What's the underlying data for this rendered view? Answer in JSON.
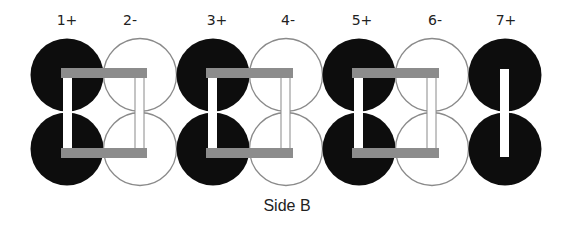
{
  "diagram": {
    "caption": "Side B",
    "colors": {
      "positive_fill": "#0d0d0d",
      "negative_fill": "#ffffff",
      "negative_stroke": "#8a8a8a",
      "bar_fill": "#8c8c8c",
      "post_fill": "#ffffff",
      "post_stroke": "#8a8a8a"
    },
    "cells": [
      {
        "label": "1+",
        "polarity": "positive",
        "cx": 67
      },
      {
        "label": "2-",
        "polarity": "negative",
        "cx": 140
      },
      {
        "label": "3+",
        "polarity": "positive",
        "cx": 213
      },
      {
        "label": "4-",
        "polarity": "negative",
        "cx": 286
      },
      {
        "label": "5+",
        "polarity": "positive",
        "cx": 359
      },
      {
        "label": "6-",
        "polarity": "negative",
        "cx": 432
      },
      {
        "label": "7+",
        "polarity": "positive",
        "cx": 505
      }
    ],
    "connectors": [
      {
        "name": "link-1-2",
        "from": "1+",
        "to": "2-",
        "x1": 61,
        "x2": 147
      },
      {
        "name": "link-3-4",
        "from": "3+",
        "to": "4-",
        "x1": 206,
        "x2": 293
      },
      {
        "name": "link-5-6",
        "from": "5+",
        "to": "6-",
        "x1": 352,
        "x2": 439
      }
    ],
    "terminal_post": {
      "cell": "7+",
      "x": 500,
      "width": 9
    }
  }
}
